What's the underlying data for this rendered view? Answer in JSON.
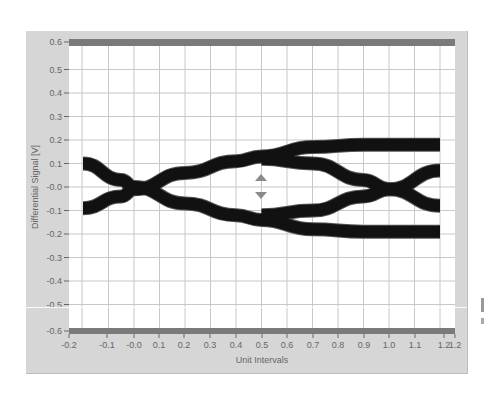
{
  "chart_data": {
    "type": "line",
    "subtype": "eye-diagram",
    "title": "",
    "xlabel": "Unit Intervals",
    "ylabel": "Differential Signal [V]",
    "xlim": [
      -0.2,
      1.2
    ],
    "ylim": [
      -0.6,
      0.6
    ],
    "grid": true,
    "x_ticks": [
      "-0.2",
      "-0.1",
      "-0.0",
      "0.1",
      "0.2",
      "0.3",
      "0.4",
      "0.5",
      "0.6",
      "0.7",
      "0.8",
      "0.9",
      "1.0",
      "1.1",
      "1.2",
      "1.2"
    ],
    "y_ticks": [
      "0.6",
      "0.5",
      "0.4",
      "0.3",
      "0.2",
      "0.1",
      "-0.0",
      "-0.1",
      "-0.2",
      "-0.3",
      "-0.4",
      "-0.5",
      "-0.6"
    ],
    "series": [
      {
        "name": "rising-trace-1",
        "x": [
          -0.2,
          -0.05,
          0.0,
          0.2,
          0.4,
          0.5,
          0.7,
          0.9,
          1.0,
          1.2
        ],
        "y": [
          -0.09,
          -0.04,
          -0.01,
          0.06,
          0.11,
          0.13,
          0.17,
          0.18,
          0.18,
          0.18
        ]
      },
      {
        "name": "falling-trace-1",
        "x": [
          -0.2,
          -0.05,
          0.0,
          0.2,
          0.4,
          0.5,
          0.7,
          0.9,
          1.0,
          1.2
        ],
        "y": [
          0.1,
          0.03,
          0.0,
          -0.07,
          -0.12,
          -0.14,
          -0.18,
          -0.19,
          -0.19,
          -0.19
        ]
      },
      {
        "name": "upper-crossing-trace",
        "x": [
          0.5,
          0.7,
          0.9,
          1.0,
          1.2
        ],
        "y": [
          0.12,
          0.1,
          0.03,
          -0.01,
          -0.08
        ]
      },
      {
        "name": "lower-crossing-trace",
        "x": [
          0.5,
          0.7,
          0.9,
          1.0,
          1.2
        ],
        "y": [
          -0.12,
          -0.1,
          -0.04,
          -0.01,
          0.07
        ]
      }
    ],
    "annotations": [
      {
        "type": "marker",
        "shape": "up-triangle",
        "x": 0.5,
        "y": 0.05
      },
      {
        "type": "marker",
        "shape": "down-triangle",
        "x": 0.5,
        "y": -0.04
      }
    ],
    "colors": {
      "trace": "#111111",
      "grid": "#c8c8c8",
      "frame": "#d6d6d6",
      "limit_bar": "#7a7a7a",
      "marker": "#8a8a8a"
    }
  }
}
